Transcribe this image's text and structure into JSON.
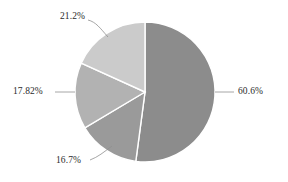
{
  "chart_data": {
    "type": "pie",
    "title": "",
    "subtitle": "",
    "xlabel": "",
    "ylabel": "",
    "legend": "none",
    "grid": false,
    "start_angle_deg": 0,
    "direction": "clockwise",
    "center": {
      "x": 145,
      "y": 92
    },
    "radius": 70,
    "labels": [
      "60.6%",
      "16.7%",
      "17.82%",
      "21.2%"
    ],
    "values": [
      60.6,
      16.7,
      17.82,
      21.2
    ],
    "total": 116.32,
    "slices": [
      {
        "label": "60.6%",
        "value": 60.6,
        "color": "#8c8c8c",
        "label_position": "right",
        "leader": "straight-horizontal"
      },
      {
        "label": "16.7%",
        "value": 16.7,
        "color": "#9a9a9a",
        "label_position": "bottom-left",
        "leader": "curved"
      },
      {
        "label": "17.82%",
        "value": 17.82,
        "color": "#b2b2b2",
        "label_position": "left",
        "leader": "straight-horizontal"
      },
      {
        "label": "21.2%",
        "value": 21.2,
        "color": "#cbcbcb",
        "label_position": "top-left",
        "leader": "curved"
      }
    ],
    "colors": {
      "background": "#ffffff",
      "slice_border": "#ffffff",
      "leader_line": "#8f8f8f",
      "label_text": "#2b2b2b"
    }
  }
}
